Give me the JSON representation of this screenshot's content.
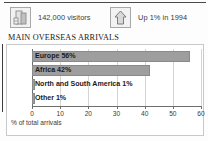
{
  "stats": [
    {
      "icon": "buildings-icon",
      "label": "142,000 visitors"
    },
    {
      "icon": "up-arrow-icon",
      "label": "Up 1% in 1994"
    }
  ],
  "heading": "MAIN OVERSEAS ARRIVALS",
  "chart_data": {
    "type": "bar",
    "orientation": "horizontal",
    "title": "MAIN OVERSEAS ARRIVALS",
    "categories": [
      "Europe",
      "Africa",
      "North and South America",
      "Other"
    ],
    "values": [
      56,
      42,
      1,
      1
    ],
    "bar_labels": [
      "Europe 56%",
      "Africa 42%",
      "North and South America 1%",
      "Other 1%"
    ],
    "xlabel": "% of total arrivals",
    "ylabel": "",
    "xlim": [
      0,
      60
    ],
    "xticks": [
      0,
      10,
      20,
      30,
      40,
      50,
      60
    ],
    "xtick_labels": [
      "0",
      "10",
      "20",
      "30",
      "40",
      "50",
      "60"
    ],
    "grid": true,
    "legend": false,
    "bar_color": "#9e9e9e",
    "axis_color": "#6e6e6e"
  }
}
